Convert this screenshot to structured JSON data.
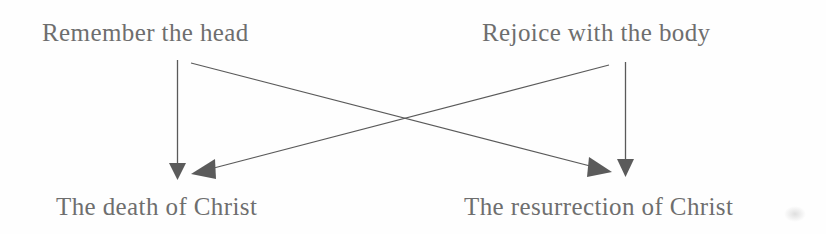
{
  "diagram": {
    "type": "crossing-arrows-concept-map",
    "background_color": "#fefefe",
    "ink_color": "#6e6e6e",
    "arrow_color": "#555555",
    "nodes": {
      "top_left": "Remember the head",
      "top_right": "Rejoice with the body",
      "bottom_left": "The death of Christ",
      "bottom_right": "The resurrection of Christ"
    },
    "connections": [
      {
        "name": "remember-head-to-death-of-christ",
        "from": "Remember the head",
        "to": "The death of Christ",
        "style": "vertical-straight-arrow",
        "arrowhead": "down"
      },
      {
        "name": "remember-head-to-resurrection-of-christ",
        "from": "Remember the head",
        "to": "The resurrection of Christ",
        "style": "diagonal-arrow",
        "arrowhead": "right-down"
      },
      {
        "name": "rejoice-body-to-resurrection-of-christ",
        "from": "Rejoice with the body",
        "to": "The resurrection of Christ",
        "style": "vertical-straight-arrow",
        "arrowhead": "down"
      },
      {
        "name": "rejoice-body-to-death-of-christ",
        "from": "Rejoice with the body",
        "to": "The death of Christ",
        "style": "diagonal-arrow",
        "arrowhead": "left-down"
      }
    ]
  }
}
